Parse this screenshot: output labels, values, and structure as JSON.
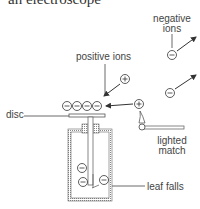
{
  "title": "an electroscope",
  "labels": {
    "negative_ions_line1": "negative",
    "negative_ions_line2": "ions",
    "positive_ions": "positive ions",
    "disc": "disc",
    "lighted_match_line1": "lighted",
    "lighted_match_line2": "match",
    "leaf_falls": "leaf falls"
  },
  "symbols": {
    "negative": "−",
    "positive": "+"
  },
  "colors": {
    "ink": "#333333",
    "text": "#444444",
    "hatch": "#888888"
  }
}
